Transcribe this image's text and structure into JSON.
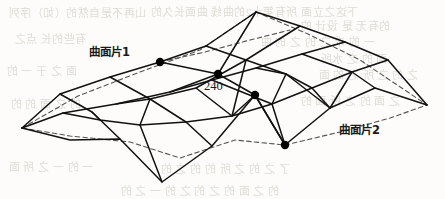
{
  "figure": {
    "kind": "surface-patch-mesh-diagram",
    "width": 445,
    "height": 199,
    "background_color": "#fdfcfa",
    "ink_color": "#111111",
    "dashed_color": "#555555",
    "ghost_color": "#cfc9c2",
    "labels": {
      "patch1": "曲面片1",
      "patch2": "曲面片2",
      "page_number": "240"
    },
    "ghost_text": [
      {
        "text": "山再不是自然的（如）序列",
        "x": 8,
        "y": 4,
        "size": 11
      },
      {
        "text": "下这之立面 所有第十2的曲线 曲面长久的",
        "x": 150,
        "y": 3,
        "size": 11
      },
      {
        "text": "的有无 是 设计 的",
        "x": 300,
        "y": 17,
        "size": 11
      },
      {
        "text": "有些的长 点之",
        "x": 14,
        "y": 30,
        "size": 11
      },
      {
        "text": "一 的 求 之 的 之 的 曲",
        "x": 260,
        "y": 33,
        "size": 11
      },
      {
        "text": "面 的 之 水所",
        "x": 320,
        "y": 50,
        "size": 11
      },
      {
        "text": "面 之 于 一 的",
        "x": 6,
        "y": 62,
        "size": 11
      },
      {
        "text": "之 的 之 所 之 的 面",
        "x": 318,
        "y": 66,
        "size": 11
      },
      {
        "text": "的 之 面 的 的",
        "x": 10,
        "y": 95,
        "size": 11
      },
      {
        "text": "之 面 的 之 所 面 的",
        "x": 300,
        "y": 92,
        "size": 11
      },
      {
        "text": "一 的 一 之 所 面",
        "x": 8,
        "y": 158,
        "size": 11
      },
      {
        "text": "了 之 的 之 所 的 的 之 的",
        "x": 160,
        "y": 160,
        "size": 11
      },
      {
        "text": "的 之 面 的 之 的 之 的 一 之 的",
        "x": 120,
        "y": 182,
        "size": 11
      }
    ],
    "geometry": {
      "description": "Two joined curved surface patches drawn as a quadrilateral control mesh with dashed boundary curves; four emphasized junction nodes.",
      "solid_polylines": [
        [
          [
            22,
            128
          ],
          [
            60,
            94
          ],
          [
            110,
            77
          ],
          [
            160,
            62
          ],
          [
            206,
            46
          ],
          [
            256,
            12
          ]
        ],
        [
          [
            22,
            128
          ],
          [
            63,
            113
          ],
          [
            116,
            104
          ],
          [
            170,
            92
          ],
          [
            218,
            74
          ],
          [
            256,
            12
          ]
        ],
        [
          [
            22,
            128
          ],
          [
            70,
            140
          ],
          [
            120,
            139
          ],
          [
            162,
            182
          ],
          [
            212,
            146
          ],
          [
            255,
            95
          ],
          [
            285,
            145
          ],
          [
            330,
            108
          ],
          [
            375,
            88
          ],
          [
            427,
            105
          ]
        ],
        [
          [
            256,
            12
          ],
          [
            300,
            26
          ],
          [
            345,
            42
          ],
          [
            388,
            60
          ],
          [
            427,
            105
          ]
        ],
        [
          [
            160,
            62
          ],
          [
            218,
            74
          ],
          [
            255,
            95
          ],
          [
            285,
            145
          ]
        ],
        [
          [
            206,
            46
          ],
          [
            246,
            60
          ],
          [
            286,
            74
          ],
          [
            330,
            108
          ]
        ],
        [
          [
            110,
            77
          ],
          [
            150,
            99
          ],
          [
            186,
            122
          ],
          [
            212,
            146
          ]
        ],
        [
          [
            60,
            94
          ],
          [
            92,
            112
          ],
          [
            120,
            139
          ]
        ],
        [
          [
            63,
            113
          ],
          [
            100,
            120
          ],
          [
            140,
            125
          ],
          [
            186,
            122
          ],
          [
            232,
            116
          ],
          [
            272,
            104
          ],
          [
            312,
            88
          ],
          [
            352,
            72
          ],
          [
            388,
            60
          ]
        ],
        [
          [
            116,
            104
          ],
          [
            150,
            99
          ],
          [
            196,
            88
          ],
          [
            246,
            60
          ],
          [
            300,
            26
          ]
        ],
        [
          [
            170,
            92
          ],
          [
            212,
            80
          ],
          [
            256,
            68
          ],
          [
            302,
            54
          ],
          [
            345,
            42
          ]
        ],
        [
          [
            256,
            68
          ],
          [
            286,
            74
          ],
          [
            312,
            88
          ],
          [
            330,
            108
          ]
        ],
        [
          [
            196,
            88
          ],
          [
            232,
            116
          ],
          [
            255,
            95
          ]
        ],
        [
          [
            212,
            80
          ],
          [
            272,
            104
          ],
          [
            285,
            145
          ]
        ],
        [
          [
            140,
            125
          ],
          [
            162,
            182
          ]
        ],
        [
          [
            92,
            112
          ],
          [
            100,
            120
          ]
        ],
        [
          [
            302,
            54
          ],
          [
            352,
            72
          ],
          [
            375,
            88
          ]
        ],
        [
          [
            150,
            99
          ],
          [
            140,
            125
          ]
        ],
        [
          [
            286,
            74
          ],
          [
            272,
            104
          ]
        ],
        [
          [
            246,
            60
          ],
          [
            232,
            116
          ]
        ],
        [
          [
            352,
            72
          ],
          [
            330,
            108
          ]
        ]
      ],
      "dashed_polylines": [
        [
          [
            22,
            128
          ],
          [
            78,
            96
          ],
          [
            140,
            72
          ],
          [
            200,
            50
          ],
          [
            256,
            12
          ]
        ],
        [
          [
            22,
            128
          ],
          [
            70,
            136
          ],
          [
            130,
            142
          ],
          [
            180,
            158
          ],
          [
            235,
            140
          ],
          [
            285,
            145
          ]
        ],
        [
          [
            256,
            12
          ],
          [
            308,
            34
          ],
          [
            360,
            60
          ],
          [
            427,
            105
          ]
        ],
        [
          [
            285,
            145
          ],
          [
            340,
            132
          ],
          [
            390,
            118
          ],
          [
            427,
            105
          ]
        ],
        [
          [
            160,
            62
          ],
          [
            205,
            52
          ],
          [
            250,
            40
          ],
          [
            290,
            30
          ]
        ]
      ],
      "nodes": [
        {
          "name": "node-patch1-corner",
          "x": 160,
          "y": 62,
          "r": 4.2
        },
        {
          "name": "node-center-upper",
          "x": 218,
          "y": 74,
          "r": 4.2
        },
        {
          "name": "node-center-lower",
          "x": 255,
          "y": 95,
          "r": 4.2
        },
        {
          "name": "node-patch2-corner",
          "x": 285,
          "y": 145,
          "r": 4.2
        }
      ]
    }
  }
}
